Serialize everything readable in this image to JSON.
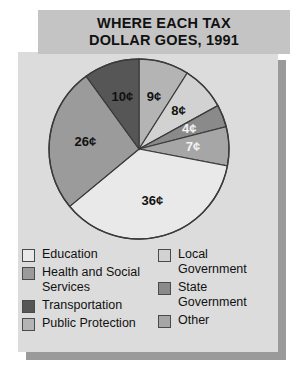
{
  "title": {
    "line1": "WHERE EACH TAX",
    "line2": "DOLLAR GOES, 1991"
  },
  "colors": {
    "title_panel": "#c4c4c4",
    "body_panel": "#dcdcdc",
    "shadow": "#9a9a9a",
    "outline": "#3a3a3a",
    "education": "#e9e9e9",
    "health_and_social_services": "#9b9b9b",
    "transportation": "#565656",
    "public_protection": "#b4b4b4",
    "local_government": "#d2d2d2",
    "state_government": "#8a8a8a",
    "other": "#a6a6a6"
  },
  "chart_data": {
    "type": "pie",
    "title": "WHERE EACH TAX DOLLAR GOES, 1991",
    "unit": "cents",
    "total": 100,
    "legend_position": "bottom",
    "grid": false,
    "categories": [
      "Public Protection",
      "Local Government",
      "State Government",
      "Other",
      "Education",
      "Health and Social Services",
      "Transportation"
    ],
    "values": [
      9,
      8,
      4,
      7,
      36,
      26,
      10
    ],
    "labels": [
      "9¢",
      "8¢",
      "4¢",
      "7¢",
      "36¢",
      "26¢",
      "10¢"
    ],
    "slices": [
      {
        "label": "9¢",
        "value": 9,
        "category": "Public Protection",
        "color": "#b4b4b4",
        "label_color": "dark"
      },
      {
        "label": "8¢",
        "value": 8,
        "category": "Local Government",
        "color": "#d2d2d2",
        "label_color": "dark"
      },
      {
        "label": "4¢",
        "value": 4,
        "category": "State Government",
        "color": "#8a8a8a",
        "label_color": "light"
      },
      {
        "label": "7¢",
        "value": 7,
        "category": "Other",
        "color": "#a6a6a6",
        "label_color": "light"
      },
      {
        "label": "36¢",
        "value": 36,
        "category": "Education",
        "color": "#e9e9e9",
        "label_color": "dark"
      },
      {
        "label": "26¢",
        "value": 26,
        "category": "Health and Social Services",
        "color": "#9b9b9b",
        "label_color": "dark"
      },
      {
        "label": "10¢",
        "value": 10,
        "category": "Transportation",
        "color": "#565656",
        "label_color": "dark"
      }
    ]
  },
  "legend": {
    "left_column": [
      {
        "label": "Education",
        "color": "#e9e9e9"
      },
      {
        "label": "Health and Social\nServices",
        "color": "#9b9b9b"
      },
      {
        "label": " Transportation",
        "color": "#565656"
      },
      {
        "label": "Public Protection",
        "color": "#b4b4b4"
      }
    ],
    "right_column": [
      {
        "label": "Local\nGovernment",
        "color": "#d2d2d2"
      },
      {
        "label": "State\nGovernment",
        "color": "#8a8a8a"
      },
      {
        "label": "Other",
        "color": "#a6a6a6"
      }
    ]
  }
}
